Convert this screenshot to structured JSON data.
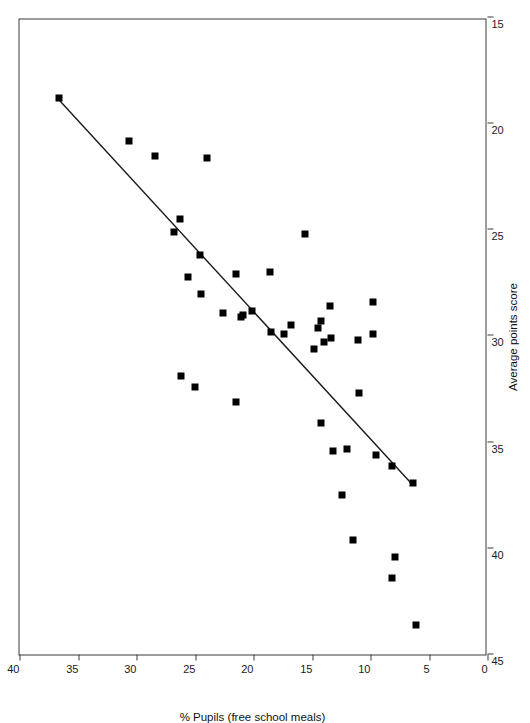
{
  "figure": {
    "background": "#ffffff",
    "point_color": "#000000",
    "axis_color": "#3a3a3a",
    "trend_color": "#1a1a1a"
  },
  "chart_data": {
    "type": "scatter",
    "title": "",
    "xlabel": "Average points score",
    "ylabel": "% Pupils (free school meals)",
    "orientation": "rotated-90",
    "grid": false,
    "legend": "none",
    "xlim": [
      15,
      45
    ],
    "ylim": [
      0,
      40
    ],
    "xticks": [
      15,
      20,
      25,
      30,
      35,
      40,
      45
    ],
    "yticks": [
      0,
      5,
      10,
      15,
      20,
      25,
      30,
      35,
      40
    ],
    "xtick_labels": [
      "15",
      "20",
      "25",
      "30",
      "35",
      "40",
      "45"
    ],
    "ytick_labels": [
      "0",
      "5",
      "10",
      "15",
      "20",
      "25",
      "30",
      "35",
      "40"
    ],
    "x_axis_direction": "decreasing-left-to-right",
    "series": [
      {
        "name": "Schools",
        "marker": "square",
        "points": [
          {
            "x": 43.6,
            "y": 6.1
          },
          {
            "x": 41.4,
            "y": 8.2
          },
          {
            "x": 40.4,
            "y": 7.9
          },
          {
            "x": 39.6,
            "y": 11.5
          },
          {
            "x": 37.5,
            "y": 12.4
          },
          {
            "x": 36.9,
            "y": 6.4
          },
          {
            "x": 36.1,
            "y": 8.2
          },
          {
            "x": 35.6,
            "y": 9.5
          },
          {
            "x": 35.4,
            "y": 13.2
          },
          {
            "x": 35.3,
            "y": 12.0
          },
          {
            "x": 34.1,
            "y": 14.2
          },
          {
            "x": 33.1,
            "y": 21.5
          },
          {
            "x": 32.7,
            "y": 11.0
          },
          {
            "x": 32.4,
            "y": 25.0
          },
          {
            "x": 31.9,
            "y": 26.2
          },
          {
            "x": 30.6,
            "y": 14.8
          },
          {
            "x": 30.3,
            "y": 14.0
          },
          {
            "x": 30.2,
            "y": 11.1
          },
          {
            "x": 30.1,
            "y": 13.4
          },
          {
            "x": 29.9,
            "y": 9.8
          },
          {
            "x": 29.8,
            "y": 18.5
          },
          {
            "x": 29.9,
            "y": 17.4
          },
          {
            "x": 29.6,
            "y": 14.5
          },
          {
            "x": 29.5,
            "y": 16.8
          },
          {
            "x": 29.3,
            "y": 14.2
          },
          {
            "x": 29.0,
            "y": 20.9
          },
          {
            "x": 29.1,
            "y": 21.1
          },
          {
            "x": 28.9,
            "y": 22.6
          },
          {
            "x": 28.8,
            "y": 20.1
          },
          {
            "x": 28.6,
            "y": 13.5
          },
          {
            "x": 28.4,
            "y": 9.8
          },
          {
            "x": 28.0,
            "y": 24.5
          },
          {
            "x": 27.2,
            "y": 25.6
          },
          {
            "x": 27.1,
            "y": 21.5
          },
          {
            "x": 27.0,
            "y": 18.6
          },
          {
            "x": 26.2,
            "y": 24.6
          },
          {
            "x": 25.1,
            "y": 26.8
          },
          {
            "x": 25.2,
            "y": 15.6
          },
          {
            "x": 24.5,
            "y": 26.3
          },
          {
            "x": 21.6,
            "y": 24.0
          },
          {
            "x": 21.5,
            "y": 28.4
          },
          {
            "x": 20.8,
            "y": 30.6
          },
          {
            "x": 18.8,
            "y": 36.6
          }
        ]
      }
    ],
    "trendline": {
      "type": "linear-fit",
      "description": "straight fitted line",
      "from": {
        "x": 36.9,
        "y": 6.4
      },
      "to": {
        "x": 18.8,
        "y": 36.6
      }
    }
  }
}
